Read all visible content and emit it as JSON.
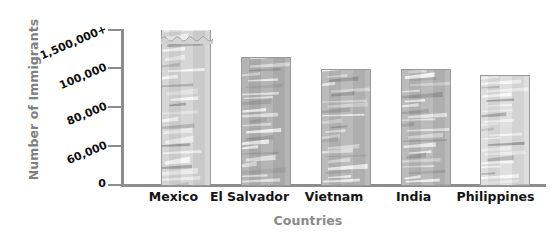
{
  "chart_data": {
    "type": "bar",
    "title": "",
    "xlabel": "Countries",
    "ylabel": "Number of Immigrants",
    "categories": [
      "Mexico",
      "El Salvador",
      "Vietnam",
      "India",
      "Philippines"
    ],
    "values": [
      1500000,
      105000,
      100500,
      100500,
      98000
    ],
    "value_labels": [
      "1,500,000+",
      "105,000",
      "100,500",
      "100,500",
      "98,000"
    ],
    "ytick_labels": [
      "0",
      "60,000",
      "80,000",
      "100,000",
      "1,500,000+"
    ],
    "ytick_positions_px": [
      185,
      146,
      107,
      68,
      30
    ],
    "ylim": [
      0,
      1500000
    ],
    "axis_note": "broken / non-linear y-axis; top bar drawn with wavy break top",
    "grid": false,
    "legend": null,
    "series": [
      {
        "name": "Number of Immigrants",
        "values": [
          1500000,
          105000,
          100500,
          100500,
          98000
        ]
      }
    ],
    "bar_colors": [
      "#d2d2d2",
      "#adadad",
      "#b4b4b4",
      "#b4b4b4",
      "#dcdcdc"
    ]
  },
  "axes": {
    "y_title": "Number of Immigrants",
    "x_title": "Countries",
    "y_ticks": [
      {
        "label": "1,500,000+",
        "y": 30,
        "slanted": true
      },
      {
        "label": "100,000",
        "y": 68,
        "slanted": true
      },
      {
        "label": "80,000",
        "y": 107,
        "slanted": true
      },
      {
        "label": "60,000",
        "y": 146,
        "slanted": true
      },
      {
        "label": "0",
        "y": 185,
        "slanted": false
      }
    ]
  },
  "bars": [
    {
      "label": "Mexico",
      "x": 38,
      "width": 50,
      "top": 4,
      "color": "#d2d2d2",
      "broken_top": true
    },
    {
      "label": "El Salvador",
      "x": 118,
      "width": 50,
      "top": 31,
      "color": "#adadad",
      "broken_top": false
    },
    {
      "label": "Vietnam",
      "x": 198,
      "width": 50,
      "top": 43,
      "color": "#b4b4b4",
      "broken_top": false
    },
    {
      "label": "India",
      "x": 278,
      "width": 50,
      "top": 43,
      "color": "#b4b4b4",
      "broken_top": false
    },
    {
      "label": "Philippines",
      "x": 357,
      "width": 50,
      "top": 49,
      "color": "#dcdcdc",
      "broken_top": false
    }
  ],
  "bar_label_slots": [
    {
      "label": "Mexico",
      "left": 131,
      "width": 85
    },
    {
      "label": "El Salvador",
      "left": 202,
      "width": 95
    },
    {
      "label": "Vietnam",
      "left": 289,
      "width": 90
    },
    {
      "label": "India",
      "left": 376,
      "width": 75
    },
    {
      "label": "Philippines",
      "left": 443,
      "width": 105
    }
  ]
}
